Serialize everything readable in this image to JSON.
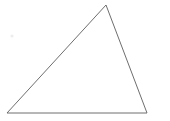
{
  "canvas": {
    "width": 170,
    "height": 121,
    "background_color": "#ffffff"
  },
  "figure": {
    "kind": "triangle",
    "stroke_color": "#6e6e6e",
    "stroke_width": 1,
    "fill_color": "none",
    "vertices": [
      {
        "name": "apex",
        "x": 106,
        "y": 5
      },
      {
        "name": "bottom-right",
        "x": 147,
        "y": 113
      },
      {
        "name": "bottom-left",
        "x": 7,
        "y": 113
      }
    ],
    "points_attr": "106,5 147,113 7,113",
    "edges": [
      {
        "name": "left-edge",
        "from": "bottom-left",
        "to": "apex"
      },
      {
        "name": "right-edge",
        "from": "apex",
        "to": "bottom-right"
      },
      {
        "name": "base-edge",
        "from": "bottom-left",
        "to": "bottom-right"
      }
    ]
  },
  "artifacts": {
    "speck": {
      "name": "faint-speck",
      "x": 12,
      "y": 36,
      "radius": 1.6,
      "color": "#ededed"
    }
  }
}
